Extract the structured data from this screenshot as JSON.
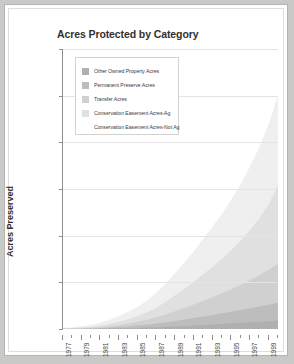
{
  "chart_data": {
    "type": "area",
    "title": "Acres Protected by Category",
    "xlabel": "",
    "ylabel": "Acres Preserved",
    "ylim": [
      0,
      30000
    ],
    "yticks": [
      0,
      5000,
      10000,
      15000,
      20000,
      25000,
      30000
    ],
    "ytick_labels": [
      "0",
      "5000",
      "10000",
      "15000",
      "20000",
      "25000",
      "30000"
    ],
    "grid": true,
    "stacked": true,
    "legend_position": "upper-left",
    "x": [
      1977,
      1978,
      1979,
      1980,
      1981,
      1982,
      1983,
      1984,
      1985,
      1986,
      1987,
      1988,
      1989,
      1990,
      1991,
      1992,
      1993,
      1994,
      1995,
      1996,
      1997,
      1998,
      1999,
      2000
    ],
    "xtick_labels": [
      "1977",
      "1979",
      "1981",
      "1983",
      "1985",
      "1987",
      "1989",
      "1991",
      "1993",
      "1995",
      "1997",
      "1999"
    ],
    "series": [
      {
        "name": "Conservation Easement Acres-Not Ag",
        "color": "#efefef",
        "values": [
          60,
          90,
          130,
          200,
          320,
          450,
          620,
          800,
          1000,
          1250,
          1600,
          2000,
          2400,
          2850,
          3300,
          3800,
          4300,
          4800,
          5400,
          6000,
          6800,
          7600,
          8600,
          9600
        ]
      },
      {
        "name": "Conservation Easement Acres-Ag",
        "color": "#e0e0e0",
        "values": [
          30,
          45,
          70,
          110,
          170,
          250,
          350,
          470,
          620,
          800,
          1050,
          1350,
          1700,
          2050,
          2450,
          2850,
          3250,
          3700,
          4200,
          4750,
          5400,
          6100,
          7000,
          8400
        ]
      },
      {
        "name": "Transfer Acres",
        "color": "#d0d0d0",
        "values": [
          20,
          30,
          45,
          70,
          110,
          160,
          230,
          310,
          410,
          530,
          680,
          850,
          1050,
          1250,
          1450,
          1680,
          1900,
          2150,
          2400,
          2700,
          3000,
          3350,
          3750,
          4200
        ]
      },
      {
        "name": "Permanent Preserve Acres",
        "color": "#bdbdbd",
        "values": [
          10,
          15,
          25,
          40,
          65,
          95,
          135,
          185,
          245,
          310,
          390,
          480,
          580,
          680,
          790,
          900,
          1010,
          1130,
          1250,
          1380,
          1500,
          1620,
          1750,
          1900
        ]
      },
      {
        "name": "Other Owned Property Acres",
        "color": "#b0b0b0",
        "values": [
          5,
          8,
          12,
          20,
          32,
          48,
          68,
          92,
          120,
          152,
          190,
          232,
          278,
          328,
          380,
          434,
          490,
          548,
          606,
          664,
          720,
          780,
          840,
          900
        ]
      }
    ],
    "legend_entries": [
      "Other Owned Property Acres",
      "Permanent Preserve Acres",
      "Transfer Acres",
      "Conservation Easement Acres-Ag",
      "Conservation Easement Acres-Not Ag"
    ],
    "legend_swatch_colors": [
      "#b0b0b0",
      "#bdbdbd",
      "#d0d0d0",
      "#e0e0e0",
      "#ffffff"
    ]
  }
}
